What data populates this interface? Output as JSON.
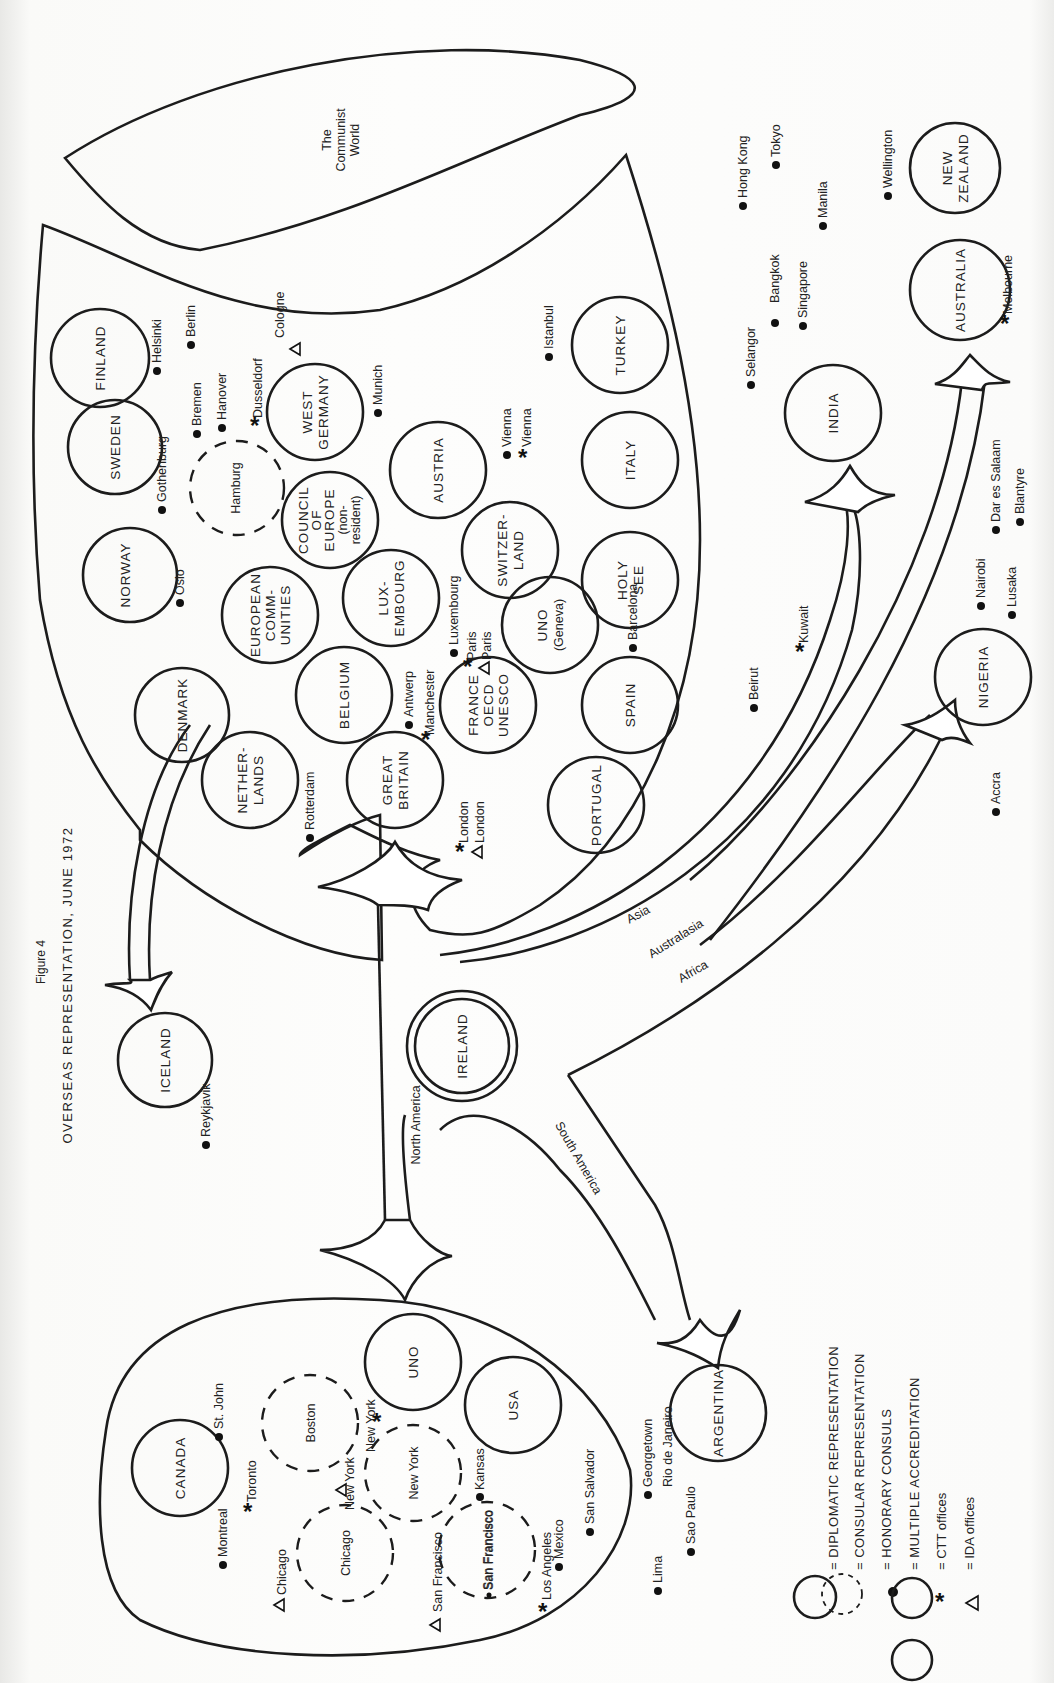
{
  "figure": {
    "label": "Figure 4",
    "title": "OVERSEAS REPRESENTATION, JUNE 1972"
  },
  "regions": {
    "communist_world": [
      "The",
      "Communist",
      "World"
    ],
    "north_america": "North America",
    "south_america": "South America",
    "asia": "Asia",
    "australasia": "Australasia",
    "africa": "Africa"
  },
  "countries": {
    "finland": [
      "FINLAND"
    ],
    "sweden": [
      "SWEDEN"
    ],
    "norway": [
      "NORWAY"
    ],
    "denmark": [
      "DENMARK"
    ],
    "iceland": [
      "ICELAND"
    ],
    "hamburg": [
      "Hamburg"
    ],
    "west_germany": [
      "WEST",
      "GERMANY"
    ],
    "council_of_europe": [
      "COUNCIL",
      "OF",
      "EUROPE",
      "(non-",
      "resident)"
    ],
    "european_communities": [
      "EUROPEAN",
      "COMM-",
      "UNITIES"
    ],
    "luxembourg": [
      "LUX-",
      "EMBOURG"
    ],
    "belgium": [
      "BELGIUM"
    ],
    "netherlands": [
      "NETHER-",
      "LANDS"
    ],
    "great_britain": [
      "GREAT",
      "BRITAIN"
    ],
    "austria": [
      "AUSTRIA"
    ],
    "switzerland": [
      "SWITZER-",
      "LAND"
    ],
    "france": [
      "FRANCE",
      "OECD",
      "UNESCO"
    ],
    "uno_geneva": [
      "UNO",
      "(Geneva)"
    ],
    "turkey": [
      "TURKEY"
    ],
    "italy": [
      "ITALY"
    ],
    "holy_see": [
      "HOLY",
      "SEE"
    ],
    "spain": [
      "SPAIN"
    ],
    "portugal": [
      "PORTUGAL"
    ],
    "india": [
      "INDIA"
    ],
    "australia": [
      "AUSTRALIA"
    ],
    "new_zealand": [
      "NEW",
      "ZEALAND"
    ],
    "nigeria": [
      "NIGERIA"
    ],
    "ireland": [
      "IRELAND"
    ],
    "canada": [
      "CANADA"
    ],
    "boston": [
      "Boston"
    ],
    "uno_new_york": [
      "UNO"
    ],
    "usa": [
      "USA"
    ],
    "new_york": [
      "New York"
    ],
    "chicago": [
      "Chicago"
    ],
    "san_francisco": [
      "San Francisco"
    ],
    "argentina": [
      "ARGENTINA"
    ]
  },
  "cities": {
    "helsinki": "Helsinki",
    "berlin": "Berlin",
    "cologne": "Cologne",
    "bremen": "Bremen",
    "hanover": "Hanover",
    "dusseldorf": "Dusseldorf",
    "munich": "Munich",
    "gothenburg": "Gothenburg",
    "oslo": "Oslo",
    "vienna_1": "Vienna",
    "vienna_2": "Vienna",
    "istanbul": "Istanbul",
    "luxembourg": "Luxembourg",
    "paris_1": "Paris",
    "paris_2": "Paris",
    "antwerp": "Antwerp",
    "manchester": "Manchester",
    "rotterdam": "Rotterdam",
    "london_1": "London",
    "london_2": "London",
    "barcelona": "Barcelona",
    "beirut": "Beirut",
    "kuwait": "Kuwait",
    "selangor": "Selangor",
    "hong_kong": "Hong Kong",
    "tokyo": "Tokyo",
    "manila": "Manila",
    "bangkok": "Bangkok",
    "singapore": "Singapore",
    "wellington": "Wellington",
    "melbourne": "Melbourne",
    "dar_es_salaam": "Dar es Salaam",
    "blantyre": "Blantyre",
    "nairobi": "Nairobi",
    "lusaka": "Lusaka",
    "accra": "Accra",
    "reykjavik": "Reykjavik",
    "st_john": "St. John",
    "toronto": "Toronto",
    "montreal": "Montreal",
    "chicago_ida": "Chicago",
    "new_york_ida": "New York",
    "new_york_ctt": "New York",
    "kansas": "Kansas",
    "san_francisco_ida": "San Francisco",
    "san_francisco_hon": "San Francisco",
    "los_angeles": "Los Angeles",
    "mexico": "Mexico",
    "san_salvador": "San Salvador",
    "georgetown": "Georgetown",
    "rio_de_janeiro": "Rio de Janeiro",
    "sao_paulo": "Sao Paulo",
    "lima": "Lima"
  },
  "legend": {
    "items": [
      {
        "symbol": "solid-circle",
        "label": "= DIPLOMATIC REPRESENTATION"
      },
      {
        "symbol": "dashed-circle",
        "label": "= CONSULAR REPRESENTATION"
      },
      {
        "symbol": "dot",
        "label": "= HONORARY CONSULS"
      },
      {
        "symbol": "joined-circles",
        "label": "= MULTIPLE ACCREDITATION"
      },
      {
        "symbol": "asterisk",
        "label": "= CTT offices"
      },
      {
        "symbol": "triangle",
        "label": "= IDA offices"
      }
    ]
  },
  "colors": {
    "ink": "#1c1c1c",
    "paper": "#fdfdfc"
  }
}
